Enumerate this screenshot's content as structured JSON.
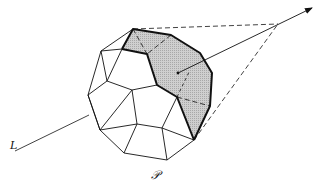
{
  "diagram": {
    "type": "polyhedron-visibility",
    "labels": {
      "line": "L",
      "polytope": "𝒫"
    },
    "colors": {
      "stroke": "#111111",
      "shade": "#c8c8c8",
      "background": "#ffffff"
    },
    "elements": [
      "polytope P (convex polyhedron)",
      "shaded visible facets",
      "line L entering polytope",
      "arrow from interior point to viewpoint",
      "dashed lines from viewpoint to silhouette"
    ]
  }
}
